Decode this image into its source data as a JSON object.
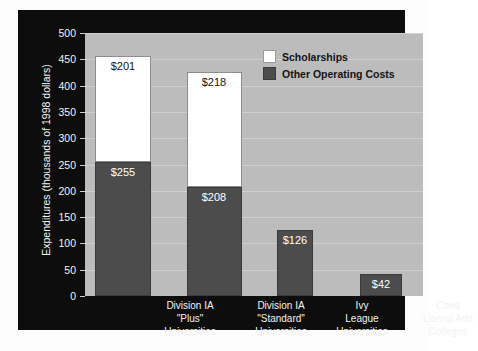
{
  "chart_data": {
    "type": "bar",
    "title": "",
    "subtitle": "",
    "xlabel": "",
    "ylabel": "Expenditures (thousands of 1998 dollars)",
    "ylim": [
      0,
      500
    ],
    "yticks": [
      0,
      50,
      100,
      150,
      200,
      250,
      300,
      350,
      400,
      450,
      500
    ],
    "grid": true,
    "stacked": true,
    "legend_position": "top-right",
    "categories": [
      "Division IA \"Plus\" Universities",
      "Division IA \"Standard\" Universities",
      "Ivy League Universities",
      "Coed Liberal Arts Colleges"
    ],
    "category_lines": [
      [
        "Division IA",
        "\"Plus\"",
        "Universities"
      ],
      [
        "Division IA",
        "\"Standard\"",
        "Universities"
      ],
      [
        "Ivy",
        "League",
        "Universities"
      ],
      [
        "Coed",
        "Liberal Arts",
        "Colleges"
      ]
    ],
    "series": [
      {
        "name": "Other Operating Costs",
        "color": "#4c4c4c",
        "values": [
          255,
          208,
          126,
          42
        ],
        "labels": [
          "$255",
          "$208",
          "$126",
          "$42"
        ]
      },
      {
        "name": "Scholarships",
        "color": "#ffffff",
        "values": [
          201,
          218,
          0,
          0
        ],
        "labels": [
          "$201",
          "$218",
          "",
          ""
        ]
      }
    ],
    "totals": [
      456,
      426,
      126,
      42
    ]
  },
  "legend": {
    "items": [
      {
        "label": "Scholarships",
        "swatch": "white"
      },
      {
        "label": "Other Operating Costs",
        "swatch": "dark-gray"
      }
    ]
  },
  "colors": {
    "panel": "#0d0d0d",
    "plot_background": "#bcbcbc",
    "gridline": "#cfcfcf",
    "bar_other": "#4c4c4c",
    "bar_scholarships": "#ffffff",
    "axis_text": "#f2f2f2",
    "legend_text": "#141414"
  }
}
